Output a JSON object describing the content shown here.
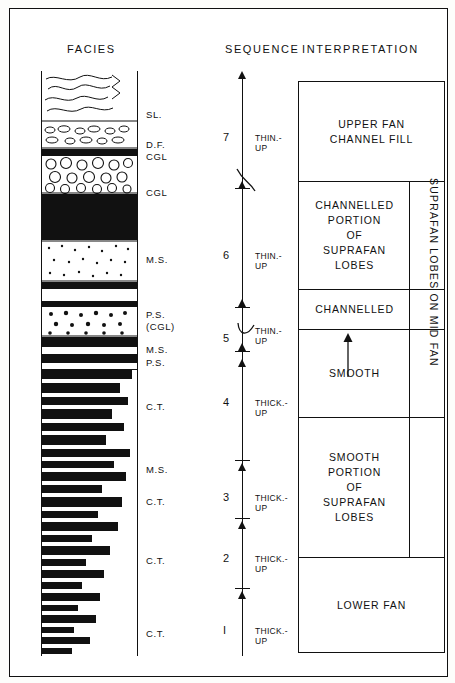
{
  "figure": {
    "headers": {
      "facies": "FACIES",
      "sequence": "SEQUENCE",
      "interpretation": "INTERPRETATION"
    }
  },
  "facies_labels": [
    {
      "text": "SL.",
      "top": 38
    },
    {
      "text": "D.F.",
      "top": 68
    },
    {
      "text": "CGL",
      "top": 80
    },
    {
      "text": "CGL",
      "top": 116
    },
    {
      "text": "M.S.",
      "top": 183
    },
    {
      "text": "P.S.",
      "top": 238
    },
    {
      "text": "(CGL)",
      "top": 250
    },
    {
      "text": "M.S.",
      "top": 273
    },
    {
      "text": "P.S.",
      "top": 286
    },
    {
      "text": "C.T.",
      "top": 330
    },
    {
      "text": "M.S.",
      "top": 393
    },
    {
      "text": "C.T.",
      "top": 425
    },
    {
      "text": "C.T.",
      "top": 484
    },
    {
      "text": "C.T.",
      "top": 557
    }
  ],
  "sequence": {
    "units": [
      {
        "number": "7",
        "trend": "THIN.-\nUP",
        "num_top": 60,
        "trend_top": 62
      },
      {
        "number": "6",
        "trend": "THIN.-\nUP",
        "num_top": 178,
        "trend_top": 180
      },
      {
        "number": "5",
        "trend": "THIN.-\nUP",
        "num_top": 261,
        "trend_top": 255
      },
      {
        "number": "4",
        "trend": "THICK.-\nUP",
        "num_top": 325,
        "trend_top": 327
      },
      {
        "number": "3",
        "trend": "THICK.-\nUP",
        "num_top": 420,
        "trend_top": 422
      },
      {
        "number": "2",
        "trend": "THICK.-\nUP",
        "num_top": 481,
        "trend_top": 483
      },
      {
        "number": "I",
        "trend": "THICK.-\nUP",
        "num_top": 553,
        "trend_top": 555
      }
    ]
  },
  "interpretation": {
    "boxes": [
      {
        "text": "UPPER FAN\nCHANNEL FILL",
        "top": 0,
        "height": 100
      },
      {
        "text": "CHANNELLED\nPORTION\nOF\nSUPRAFAN\nLOBES",
        "top": 100,
        "height": 108
      },
      {
        "text": "CHANNELLED",
        "top": 208,
        "height": 40
      },
      {
        "text": "SMOOTH",
        "top": 248,
        "height": 88
      },
      {
        "text": "SMOOTH\nPORTION\nOF\nSUPRAFAN\nLOBES",
        "top": 336,
        "height": 140
      },
      {
        "text": "LOWER FAN",
        "top": 476,
        "height": 94
      }
    ],
    "side_label": "SUPRAFAN LOBES ON MID FAN"
  },
  "colors": {
    "ink": "#111111",
    "paper": "#ffffff"
  }
}
